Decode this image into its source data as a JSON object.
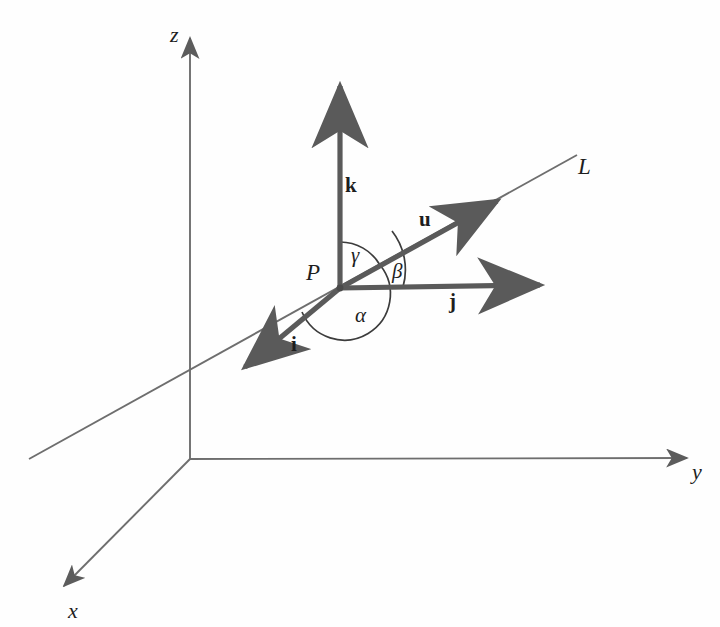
{
  "figure": {
    "background_color": "#fefefe",
    "axis_color": "#6e6e6e",
    "vector_color": "#5a5a5a",
    "arc_color": "#3c3c3c",
    "text_color": "#1e1e1e",
    "width": 720,
    "height": 627
  },
  "axes": [
    {
      "name": "z-axis",
      "label": "z",
      "from": [
        190,
        459
      ],
      "to": [
        190,
        32
      ],
      "label_pos": [
        170,
        24
      ]
    },
    {
      "name": "y-axis",
      "label": "y",
      "from": [
        190,
        459
      ],
      "to": [
        693,
        458
      ],
      "label_pos": [
        692,
        461
      ]
    },
    {
      "name": "x-axis",
      "label": "x",
      "from": [
        190,
        459
      ],
      "to": [
        58,
        592
      ],
      "label_pos": [
        68,
        600
      ]
    }
  ],
  "line": {
    "name": "line-L",
    "label": "L",
    "from": [
      29,
      459
    ],
    "to": [
      577,
      155
    ],
    "label_pos": [
      578,
      155
    ]
  },
  "point": {
    "name": "point-P",
    "label": "P",
    "pos": [
      340,
      288
    ],
    "label_pos": [
      306,
      261
    ]
  },
  "vectors": [
    {
      "name": "vector-k",
      "label": "k",
      "from": [
        340,
        288
      ],
      "to": [
        340,
        78
      ],
      "label_pos": [
        345,
        175
      ]
    },
    {
      "name": "vector-j",
      "label": "j",
      "from": [
        340,
        288
      ],
      "to": [
        548,
        285
      ],
      "label_pos": [
        449,
        291
      ]
    },
    {
      "name": "vector-i",
      "label": "i",
      "from": [
        340,
        288
      ],
      "to": [
        237,
        375
      ],
      "label_pos": [
        291,
        334
      ]
    },
    {
      "name": "vector-u",
      "label": "u",
      "from": [
        340,
        288
      ],
      "to": [
        505,
        196
      ],
      "label_pos": [
        419,
        209
      ]
    }
  ],
  "angles": [
    {
      "name": "angle-gamma",
      "label": "γ",
      "between": [
        "k",
        "u"
      ],
      "label_pos": [
        351,
        245
      ]
    },
    {
      "name": "angle-beta",
      "label": "β",
      "between": [
        "u",
        "j"
      ],
      "label_pos": [
        392,
        261
      ]
    },
    {
      "name": "angle-alpha",
      "label": "α",
      "between": [
        "i",
        "u"
      ],
      "label_pos": [
        355,
        305
      ]
    }
  ]
}
